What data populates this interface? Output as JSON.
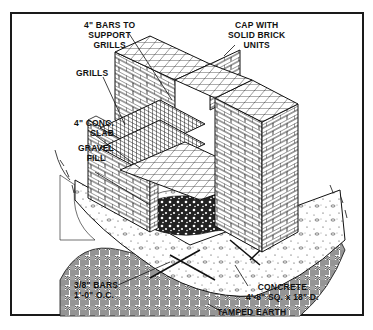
{
  "figure": {
    "labels": {
      "bars": [
        "4\" BARS TO",
        "SUPPORT",
        "GRILLS"
      ],
      "cap": [
        "CAP WITH",
        "SOLID BRICK",
        "UNITS"
      ],
      "grills": [
        "GRILLS"
      ],
      "slab": [
        "4\" CONC.",
        "SLAB"
      ],
      "gravel": [
        "GRAVEL",
        "FILL"
      ],
      "rebar": [
        "3/8\" BARS",
        "1'-0\" O.C."
      ],
      "concrete": [
        "CONCRETE",
        "4'-8\" SQ. x 18\" D."
      ],
      "earth": [
        "TAMPED EARTH"
      ]
    },
    "colors": {
      "ink": "#111111",
      "paper": "#ffffff",
      "frame": "#1a1a1a"
    }
  }
}
